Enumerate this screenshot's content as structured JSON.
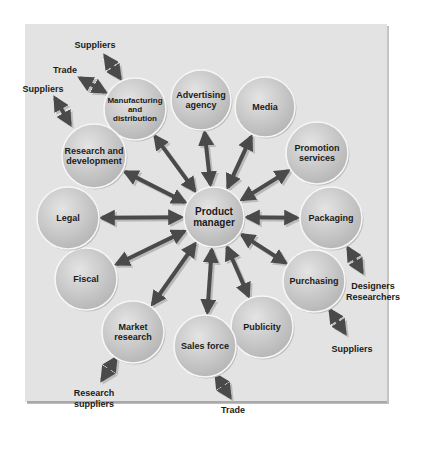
{
  "diagram": {
    "center": {
      "id": "product-manager",
      "lines": [
        "Product",
        "manager"
      ],
      "x": 214,
      "y": 217,
      "r": 30
    },
    "nodes": [
      {
        "id": "manufacturing-and-distribution",
        "lines": [
          "Manufacturing",
          "and",
          "distribution"
        ],
        "x": 135,
        "y": 109,
        "r": 31,
        "font": 8
      },
      {
        "id": "advertising-agency",
        "lines": [
          "Advertising",
          "agency"
        ],
        "x": 201,
        "y": 100,
        "r": 30,
        "font": 9
      },
      {
        "id": "media",
        "lines": [
          "Media"
        ],
        "x": 265,
        "y": 107,
        "r": 30,
        "font": 9
      },
      {
        "id": "promotion-services",
        "lines": [
          "Promotion",
          "services"
        ],
        "x": 317,
        "y": 153,
        "r": 31,
        "font": 9
      },
      {
        "id": "packaging",
        "lines": [
          "Packaging"
        ],
        "x": 331,
        "y": 218,
        "r": 31,
        "font": 9
      },
      {
        "id": "purchasing",
        "lines": [
          "Purchasing"
        ],
        "x": 314,
        "y": 281,
        "r": 31,
        "font": 9
      },
      {
        "id": "publicity",
        "lines": [
          "Publicity"
        ],
        "x": 262,
        "y": 327,
        "r": 31,
        "font": 9
      },
      {
        "id": "sales-force",
        "lines": [
          "Sales force"
        ],
        "x": 205,
        "y": 346,
        "r": 31,
        "font": 9
      },
      {
        "id": "market-research",
        "lines": [
          "Market",
          "research"
        ],
        "x": 133,
        "y": 332,
        "r": 31,
        "font": 9
      },
      {
        "id": "fiscal",
        "lines": [
          "Fiscal"
        ],
        "x": 86,
        "y": 279,
        "r": 31,
        "font": 9
      },
      {
        "id": "legal",
        "lines": [
          "Legal"
        ],
        "x": 68,
        "y": 218,
        "r": 31,
        "font": 9
      },
      {
        "id": "research-and-development",
        "lines": [
          "Research and",
          "development"
        ],
        "x": 94,
        "y": 156,
        "r": 32,
        "font": 9
      }
    ],
    "external": [
      {
        "id": "suppliers-manufacturing",
        "lines": [
          "Suppliers"
        ],
        "x": 95,
        "y": 48,
        "attach": "manufacturing-and-distribution",
        "ax1": 105,
        "ay1": 56,
        "ax2": 120,
        "ay2": 78
      },
      {
        "id": "trade-manufacturing",
        "lines": [
          "Trade"
        ],
        "x": 65,
        "y": 73,
        "attach": "manufacturing-and-distribution",
        "ax1": 80,
        "ay1": 78,
        "ax2": 105,
        "ay2": 92
      },
      {
        "id": "suppliers-research",
        "lines": [
          "Suppliers"
        ],
        "x": 43,
        "y": 92,
        "attach": "research-and-development",
        "ax1": 55,
        "ay1": 98,
        "ax2": 70,
        "ay2": 124
      },
      {
        "id": "designers-researchers-packaging",
        "lines": [
          "Designers",
          "Researchers"
        ],
        "x": 373,
        "y": 289,
        "attach": "packaging",
        "ax1": 348,
        "ay1": 248,
        "ax2": 362,
        "ay2": 272
      },
      {
        "id": "suppliers-purchasing",
        "lines": [
          "Suppliers"
        ],
        "x": 352,
        "y": 352,
        "attach": "purchasing",
        "ax1": 330,
        "ay1": 310,
        "ax2": 345,
        "ay2": 333
      },
      {
        "id": "trade-sales",
        "lines": [
          "Trade"
        ],
        "x": 233,
        "y": 413,
        "attach": "sales-force",
        "ax1": 216,
        "ay1": 375,
        "ax2": 230,
        "ay2": 397
      },
      {
        "id": "research-suppliers-market",
        "lines": [
          "Research",
          "suppliers"
        ],
        "x": 94,
        "y": 396,
        "attach": "market-research",
        "ax1": 116,
        "ay1": 358,
        "ax2": 102,
        "ay2": 380
      }
    ],
    "colors": {
      "panel": "#e3e3e3",
      "circle_fill_light": "#dedede",
      "circle_fill_dark": "#b8b8b8",
      "circle_stroke": "#f6f6f6",
      "arrow": "#4a4a4a",
      "arrow_shadow": "#b9b9b9",
      "text": "#1b1b1b"
    }
  }
}
